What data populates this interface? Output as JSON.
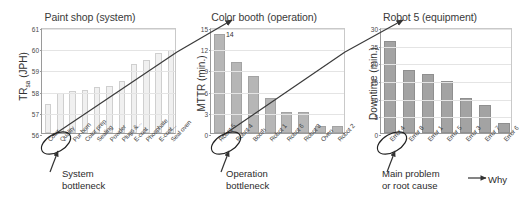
{
  "chart_data": [
    {
      "type": "bar",
      "title": "Paint shop (system)",
      "ylabel": "TRsa (JPH)",
      "ylabel_main": "TR",
      "ylabel_sub": "sa",
      "ylabel_unit": " (JPH)",
      "xlabel": "",
      "ylim": [
        56,
        61
      ],
      "yticks": [
        56,
        57,
        58,
        59,
        60,
        61
      ],
      "grid": true,
      "categories": [
        "Color",
        "Quality",
        "Pur-born",
        "Color prep",
        "Sealing",
        "Powder",
        "Plugs &...",
        "E-coat",
        "Phosphate",
        "E-coat...",
        "Seal oven"
      ],
      "values": [
        57.35,
        57.88,
        57.97,
        58.05,
        58.15,
        58.22,
        58.45,
        59.25,
        59.45,
        59.78,
        59.9
      ],
      "annotation": "System\nbottleneck",
      "annotation_line1": "System",
      "annotation_line2": "bottleneck",
      "highlight_category": "Color",
      "trend_line": true
    },
    {
      "type": "bar",
      "title": "Color booth (operation)",
      "ylabel": "MTTR (min.)",
      "xlabel": "",
      "ylim": [
        0,
        15
      ],
      "yticks": [
        0,
        3,
        6,
        9,
        12,
        15
      ],
      "grid": true,
      "categories": [
        "Robot 5",
        "Robot 4",
        "Booth",
        "Robot 1",
        "Robot 6",
        "Robot 3",
        "Oven",
        "Robot 2"
      ],
      "values": [
        14,
        10.1,
        8,
        5,
        3,
        3,
        1,
        1
      ],
      "data_labels": [
        "14",
        "",
        "",
        "",
        "",
        "",
        "",
        ""
      ],
      "annotation_line1": "Operation",
      "annotation_line2": "bottleneck",
      "highlight_category": "Robot 5",
      "trend_line": true
    },
    {
      "type": "bar",
      "title": "Robot 5 (equipment)",
      "ylabel": "Downtime (min.)",
      "xlabel": "",
      "ylim": [
        0,
        30
      ],
      "yticks": [
        0,
        5,
        10,
        15,
        20,
        25,
        30
      ],
      "grid": true,
      "categories": [
        "Error 4",
        "Error 8",
        "Error 1",
        "Error 5",
        "Error 3",
        "Error 7",
        "Error 6"
      ],
      "values": [
        26,
        17.8,
        16.8,
        14.8,
        9.8,
        7.8,
        2.8
      ],
      "annotation_line1": "Main problem",
      "annotation_line2": "or root cause",
      "annotation_why": "Why",
      "highlight_category": "Error 4",
      "trend_line": true
    }
  ],
  "colors": {
    "bar_pale": "#f0f0f0",
    "bar_mid": "#b6b6b6",
    "bar_dark": "#a3a3a3",
    "axis": "#9a9a9a",
    "grid": "#e4e4e4",
    "text": "#2b2b2b",
    "arrow": "#333333"
  }
}
